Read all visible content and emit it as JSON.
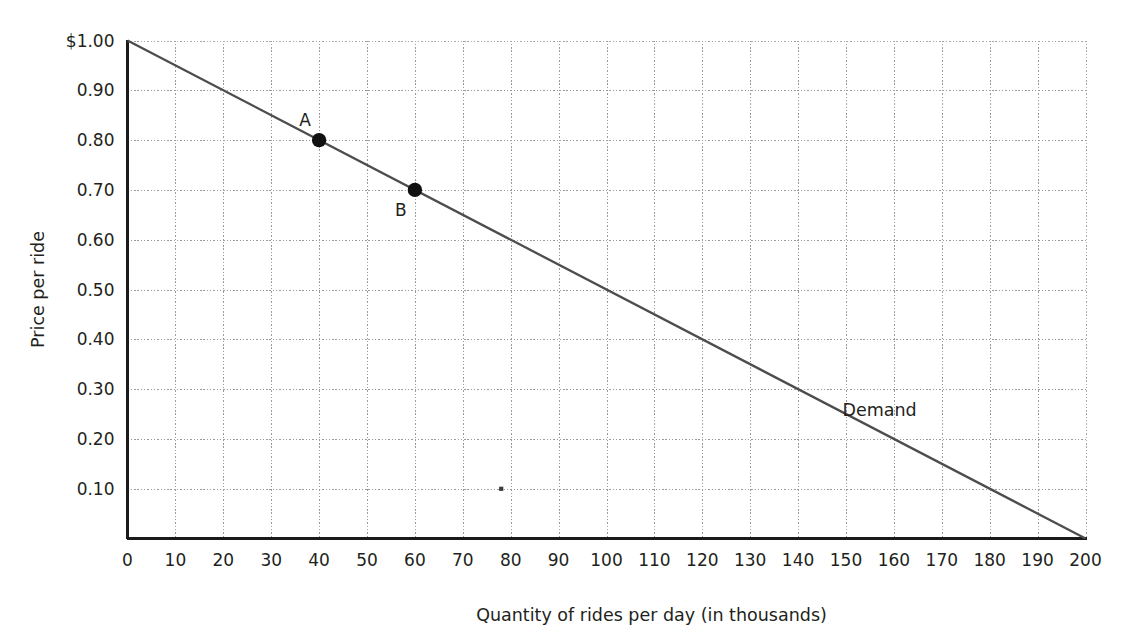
{
  "chart_data": {
    "type": "line",
    "title": "",
    "subtitle": "",
    "xlabel": "Quantity of rides per day (in thousands)",
    "ylabel": "Price per ride",
    "xlim": [
      0,
      200
    ],
    "ylim": [
      0,
      1.0
    ],
    "grid": true,
    "legend_position": "inline-right",
    "x_ticks": [
      0,
      10,
      20,
      30,
      40,
      50,
      60,
      70,
      80,
      90,
      100,
      110,
      120,
      130,
      140,
      150,
      160,
      170,
      180,
      190,
      200
    ],
    "x_tick_labels": [
      "0",
      "10",
      "20",
      "30",
      "40",
      "50",
      "60",
      "70",
      "80",
      "90",
      "100",
      "110",
      "120",
      "130",
      "140",
      "150",
      "160",
      "170",
      "180",
      "190",
      "200"
    ],
    "y_ticks": [
      0.1,
      0.2,
      0.3,
      0.4,
      0.5,
      0.6,
      0.7,
      0.8,
      0.9,
      1.0
    ],
    "y_tick_labels": [
      "0.10",
      "0.20",
      "0.30",
      "0.40",
      "0.50",
      "0.60",
      "0.70",
      "0.80",
      "0.90",
      "$1.00"
    ],
    "series": [
      {
        "name": "Demand",
        "label": "Demand",
        "color": "#4d4d4d",
        "x": [
          0,
          200
        ],
        "values": [
          1.0,
          0.0
        ]
      }
    ],
    "annotations": [
      {
        "label": "A",
        "x": 40,
        "y": 0.8,
        "label_dx": -14,
        "label_dy": -14
      },
      {
        "label": "B",
        "x": 60,
        "y": 0.7,
        "label_dx": -14,
        "label_dy": 26
      }
    ],
    "markers": [
      {
        "label": "A",
        "x": 40,
        "y": 0.8
      },
      {
        "label": "B",
        "x": 60,
        "y": 0.7
      }
    ],
    "speck": {
      "x": 78,
      "y": 0.1
    },
    "colors": {
      "line": "#4d4d4d",
      "grid": "#9a9a9a",
      "axis": "#1a1a1a",
      "text": "#231f20",
      "background": "#ffffff"
    }
  }
}
